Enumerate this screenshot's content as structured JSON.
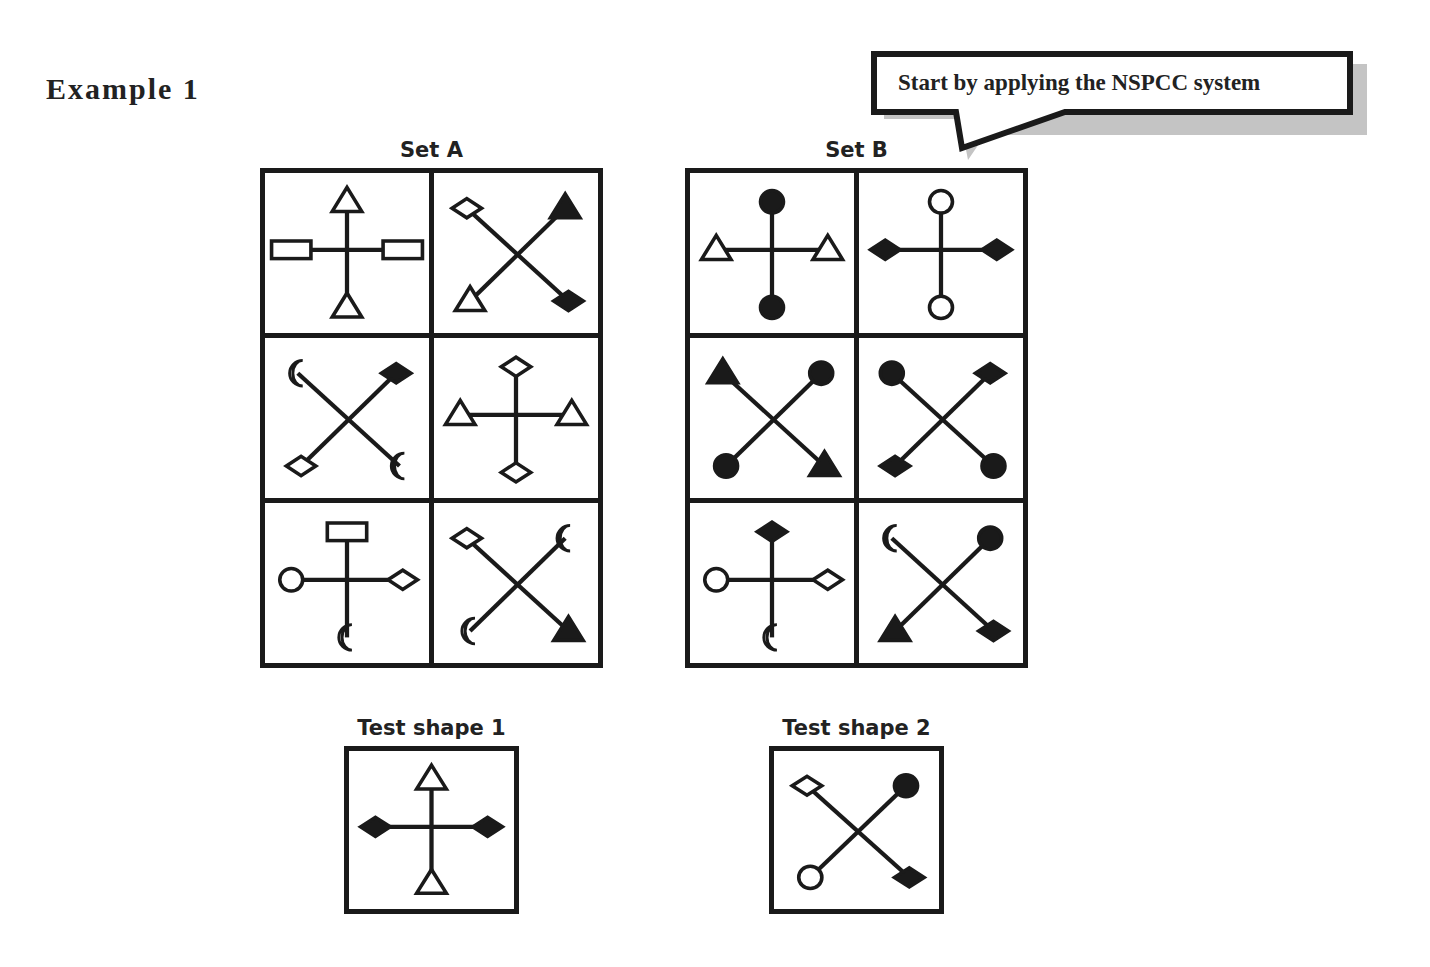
{
  "title": "Example 1",
  "callout": {
    "text": "Start by applying the NSPCC system"
  },
  "set_a": {
    "label": "Set A",
    "cells": [
      {
        "layout": "cross",
        "ends": {
          "top": "triangle-outline",
          "bottom": "triangle-outline",
          "left": "rectangle-outline",
          "right": "rectangle-outline"
        }
      },
      {
        "layout": "x",
        "ends": {
          "tl": "diamond-outline",
          "tr": "triangle-filled",
          "bl": "triangle-outline",
          "br": "diamond-filled"
        }
      },
      {
        "layout": "x",
        "ends": {
          "tl": "crescent-outline",
          "tr": "diamond-filled",
          "bl": "diamond-outline",
          "br": "crescent-filled"
        }
      },
      {
        "layout": "cross",
        "ends": {
          "top": "diamond-outline",
          "bottom": "diamond-outline",
          "left": "triangle-outline",
          "right": "triangle-outline"
        }
      },
      {
        "layout": "cross",
        "ends": {
          "top": "rectangle-outline",
          "bottom": "crescent-outline",
          "left": "circle-outline",
          "right": "diamond-outline"
        }
      },
      {
        "layout": "x",
        "ends": {
          "tl": "diamond-outline",
          "tr": "crescent-filled",
          "bl": "crescent-outline",
          "br": "triangle-filled"
        }
      }
    ]
  },
  "set_b": {
    "label": "Set B",
    "cells": [
      {
        "layout": "cross",
        "ends": {
          "top": "circle-filled",
          "bottom": "circle-filled",
          "left": "triangle-outline",
          "right": "triangle-outline"
        }
      },
      {
        "layout": "cross",
        "ends": {
          "top": "circle-outline",
          "bottom": "circle-outline",
          "left": "diamond-filled",
          "right": "diamond-filled"
        }
      },
      {
        "layout": "x",
        "ends": {
          "tl": "triangle-filled",
          "tr": "circle-filled",
          "bl": "circle-filled",
          "br": "triangle-filled"
        }
      },
      {
        "layout": "x",
        "ends": {
          "tl": "circle-filled",
          "tr": "diamond-filled",
          "bl": "diamond-filled",
          "br": "circle-filled"
        }
      },
      {
        "layout": "cross",
        "ends": {
          "top": "diamond-filled",
          "bottom": "crescent-outline",
          "left": "circle-outline",
          "right": "diamond-outline"
        }
      },
      {
        "layout": "x",
        "ends": {
          "tl": "crescent-filled",
          "tr": "circle-filled",
          "bl": "triangle-filled",
          "br": "diamond-filled"
        }
      }
    ]
  },
  "tests": [
    {
      "label": "Test shape 1",
      "layout": "cross",
      "ends": {
        "top": "triangle-outline",
        "bottom": "triangle-outline",
        "left": "diamond-filled",
        "right": "diamond-filled"
      }
    },
    {
      "label": "Test shape 2",
      "layout": "x",
      "ends": {
        "tl": "diamond-outline",
        "tr": "circle-filled",
        "bl": "circle-outline",
        "br": "diamond-filled"
      }
    }
  ],
  "colors": {
    "ink": "#1a1a1a",
    "shadow": "#bdbdbd",
    "text": "#222222"
  }
}
